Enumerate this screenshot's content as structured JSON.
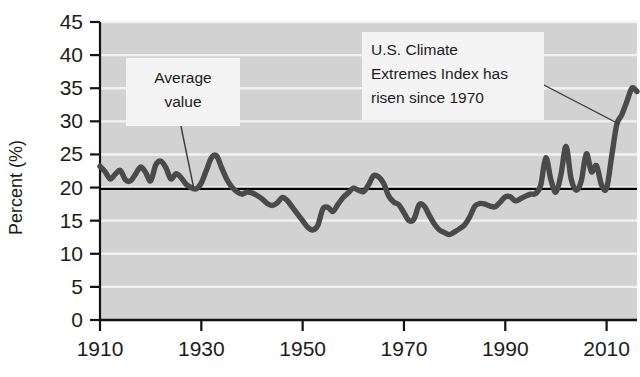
{
  "chart_data": {
    "type": "line",
    "title": "",
    "subtitle": "",
    "xlabel": "",
    "ylabel": "Percent (%)",
    "xlim": [
      1910,
      2016
    ],
    "ylim": [
      0,
      45
    ],
    "grid": true,
    "legend_position": "none",
    "y_ticks": [
      "45",
      "40",
      "35",
      "30",
      "25",
      "20",
      "15",
      "10",
      "5",
      "0"
    ],
    "y_tick_values": [
      45,
      40,
      35,
      30,
      25,
      20,
      15,
      10,
      5,
      0
    ],
    "x_ticks": [
      "1910",
      "1930",
      "1950",
      "1970",
      "1990",
      "2010"
    ],
    "x_tick_values": [
      1910,
      1930,
      1950,
      1970,
      1990,
      2010
    ],
    "series": [
      {
        "name": "U.S. Climate Extremes Index",
        "color": "#4a4a4a",
        "x": [
          1910,
          1911,
          1912,
          1913,
          1914,
          1915,
          1916,
          1917,
          1918,
          1919,
          1920,
          1921,
          1922,
          1923,
          1924,
          1925,
          1926,
          1927,
          1928,
          1929,
          1930,
          1931,
          1932,
          1933,
          1934,
          1935,
          1936,
          1937,
          1938,
          1939,
          1940,
          1941,
          1942,
          1943,
          1944,
          1945,
          1946,
          1947,
          1948,
          1949,
          1950,
          1951,
          1952,
          1953,
          1954,
          1955,
          1956,
          1957,
          1958,
          1959,
          1960,
          1961,
          1962,
          1963,
          1964,
          1965,
          1966,
          1967,
          1968,
          1969,
          1970,
          1971,
          1972,
          1973,
          1974,
          1975,
          1976,
          1977,
          1978,
          1979,
          1980,
          1981,
          1982,
          1983,
          1984,
          1985,
          1986,
          1987,
          1988,
          1989,
          1990,
          1991,
          1992,
          1993,
          1994,
          1995,
          1996,
          1997,
          1998,
          1999,
          2000,
          2001,
          2002,
          2003,
          2004,
          2005,
          2006,
          2007,
          2008,
          2009,
          2010,
          2011,
          2012,
          2013,
          2014,
          2015,
          2016
        ],
        "y": [
          23.2,
          22.4,
          21.3,
          22.0,
          22.6,
          21.2,
          21.0,
          22.0,
          23.1,
          22.3,
          21.0,
          23.4,
          24.0,
          23.0,
          21.3,
          22.1,
          21.5,
          20.5,
          20.0,
          19.8,
          20.7,
          22.6,
          24.5,
          24.8,
          23.0,
          21.3,
          20.1,
          19.4,
          19.0,
          19.3,
          19.2,
          18.8,
          18.3,
          17.6,
          17.3,
          17.7,
          18.5,
          18.0,
          17.0,
          16.0,
          15.0,
          14.0,
          13.6,
          14.3,
          16.8,
          17.0,
          16.4,
          17.5,
          18.5,
          19.2,
          19.9,
          19.6,
          19.4,
          20.4,
          21.8,
          21.6,
          20.6,
          18.7,
          17.8,
          17.4,
          16.2,
          15.0,
          15.3,
          17.4,
          17.2,
          15.8,
          14.5,
          13.6,
          13.2,
          12.9,
          13.3,
          13.8,
          14.4,
          15.6,
          17.2,
          17.6,
          17.5,
          17.2,
          17.1,
          17.8,
          18.6,
          18.6,
          18.0,
          18.3,
          18.7,
          19.0,
          19.1,
          20.4,
          24.5,
          21.2,
          19.3,
          22.0,
          26.2,
          21.3,
          19.6,
          21.0,
          25.1,
          22.4,
          23.3,
          20.4,
          19.9,
          24.7,
          29.5,
          31.0,
          33.0,
          35.0,
          34.5
        ]
      }
    ],
    "reference_line": {
      "name": "Average value",
      "value": 19.8,
      "color": "#000000"
    },
    "annotations": [
      {
        "id": "average-value",
        "text_lines": [
          "Average",
          "value"
        ],
        "text": "Average value"
      },
      {
        "id": "trend-note",
        "text_lines": [
          "U.S. Climate",
          "Extremes Index has",
          "risen since 1970"
        ],
        "text": "U.S. Climate Extremes Index has risen since 1970"
      }
    ],
    "colors": {
      "plot_background": "#d2d2d2",
      "gridline": "#f2f2f2",
      "series": "#4a4a4a",
      "axis": "#121212",
      "annotation_box": "#f4f4f4"
    }
  }
}
